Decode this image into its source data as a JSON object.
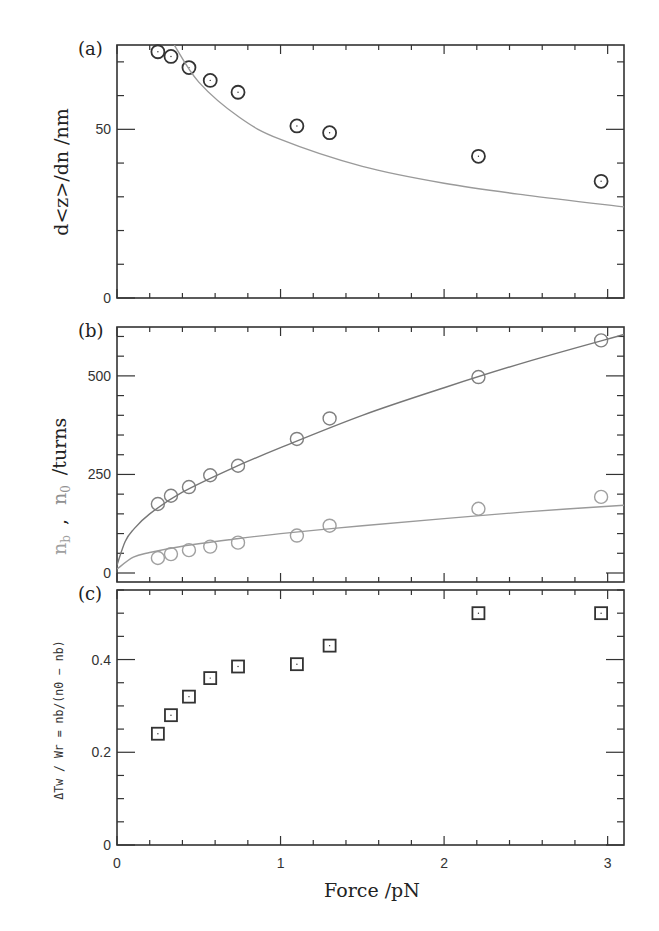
{
  "figure": {
    "xlabel": "Force /pN",
    "x_ticks": [
      "0",
      "1",
      "2",
      "3"
    ],
    "panels": [
      {
        "tag": "(a)",
        "ylabel": "d<z>/dn /nm",
        "y_ticks": [
          "0",
          "50"
        ]
      },
      {
        "tag": "(b)",
        "ylabel_nb": "n",
        "ylabel_nb_sub": "b",
        "ylabel_sep": ",",
        "ylabel_n0": "n",
        "ylabel_n0_sub": "0",
        "ylabel_unit": "/turns",
        "y_ticks": [
          "0",
          "250",
          "500"
        ]
      },
      {
        "tag": "(c)",
        "ylabel": "ΔTw / Wr = nb/(n0 − nb)",
        "y_ticks": [
          "0",
          "0.2",
          "0.4"
        ]
      }
    ],
    "colors": {
      "frame": "#333333",
      "marker_dark": "#333333",
      "marker_grey": "#9a9a9a",
      "curve": "#9a9a9a"
    }
  },
  "chart_data": [
    {
      "type": "scatter",
      "title": "(a)",
      "xlabel": "Force /pN",
      "ylabel": "d<z>/dn /nm",
      "xlim": [
        0,
        3.1
      ],
      "ylim": [
        0,
        75
      ],
      "x_ticks": [
        0,
        1,
        2,
        3
      ],
      "y_ticks": [
        0,
        50
      ],
      "grid": false,
      "series": [
        {
          "name": "data",
          "marker": "circle",
          "x": [
            0.25,
            0.33,
            0.44,
            0.57,
            0.74,
            1.1,
            1.3,
            2.21,
            2.96
          ],
          "values": [
            73,
            71.6,
            68.3,
            64.5,
            61,
            51,
            49,
            42,
            34.6
          ]
        },
        {
          "name": "model",
          "style": "line",
          "x": [
            0.35,
            0.5,
            0.75,
            1.0,
            1.5,
            2.0,
            2.5,
            3.1
          ],
          "values": [
            75,
            64,
            53.5,
            47,
            39,
            34,
            30.5,
            27
          ]
        }
      ]
    },
    {
      "type": "scatter",
      "title": "(b)",
      "xlabel": "Force /pN",
      "ylabel": "n_b , n_0 /turns",
      "xlim": [
        0,
        3.1
      ],
      "ylim": [
        0,
        624
      ],
      "x_ticks": [
        0,
        1,
        2,
        3
      ],
      "y_ticks": [
        0,
        250,
        500
      ],
      "grid": false,
      "series": [
        {
          "name": "n0",
          "marker": "circle",
          "x": [
            0.25,
            0.33,
            0.44,
            0.57,
            0.74,
            1.1,
            1.3,
            2.21,
            2.96
          ],
          "values": [
            175,
            196,
            218,
            248,
            272,
            340,
            392,
            497,
            590
          ]
        },
        {
          "name": "nb",
          "marker": "circle",
          "x": [
            0.25,
            0.33,
            0.44,
            0.57,
            0.74,
            1.1,
            1.3,
            2.21,
            2.96
          ],
          "values": [
            38,
            48,
            58,
            67,
            77,
            95,
            120,
            163,
            193
          ]
        },
        {
          "name": "n0 fit",
          "style": "line",
          "x": [
            0,
            0.05,
            0.1,
            0.2,
            0.4,
            0.7,
            1.0,
            1.5,
            2.0,
            2.5,
            3.1
          ],
          "values": [
            20,
            80,
            110,
            150,
            205,
            265,
            318,
            400,
            470,
            535,
            605
          ]
        },
        {
          "name": "nb fit",
          "style": "line",
          "x": [
            0,
            0.1,
            0.2,
            0.4,
            0.7,
            1.0,
            1.5,
            2.0,
            2.5,
            3.1
          ],
          "values": [
            10,
            40,
            52,
            68,
            85,
            100,
            120,
            138,
            155,
            172
          ]
        }
      ]
    },
    {
      "type": "scatter",
      "title": "(c)",
      "xlabel": "Force /pN",
      "ylabel": "ΔTw / Wr = nb/(n0 − nb)",
      "xlim": [
        0,
        3.1
      ],
      "ylim": [
        0,
        0.55
      ],
      "x_ticks": [
        0,
        1,
        2,
        3
      ],
      "y_ticks": [
        0,
        0.2,
        0.4
      ],
      "grid": false,
      "series": [
        {
          "name": "ratio",
          "marker": "square",
          "x": [
            0.25,
            0.33,
            0.44,
            0.57,
            0.74,
            1.1,
            1.3,
            2.21,
            2.96
          ],
          "values": [
            0.24,
            0.28,
            0.32,
            0.36,
            0.385,
            0.39,
            0.43,
            0.5,
            0.5
          ]
        }
      ]
    }
  ]
}
